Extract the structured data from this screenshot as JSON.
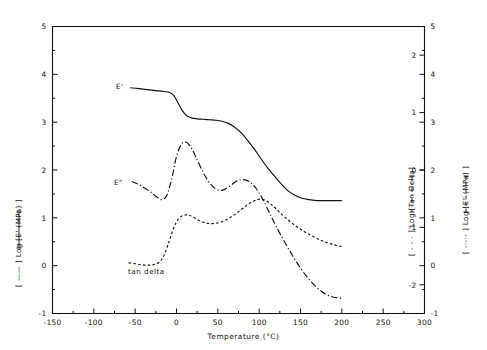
{
  "chart_data": {
    "type": "line",
    "title": "",
    "xlabel": "Temperature (°C)",
    "ylabel": "[ —— ] Log [E' (MPa) ]",
    "ylabel_right_inner": "[ - - - ] Log [Tan Delta]",
    "ylabel_right_outer": "[ -·-·- ] Log [E\" (MPa) ]",
    "xlim": [
      -150,
      300
    ],
    "ylim_left": [
      -1,
      5
    ],
    "ylim_right_inner": [
      -2.5,
      2.5
    ],
    "ylim_right_outer": [
      -1,
      5
    ],
    "xticks": [
      -150,
      -100,
      -50,
      0,
      50,
      100,
      150,
      200,
      250,
      300
    ],
    "xtick_labels": [
      "-150",
      "-100",
      "-50",
      "0",
      "50",
      "100",
      "150",
      "200",
      "250",
      "300"
    ],
    "xminor_step": 25,
    "yticks_left": [
      -1,
      0,
      1,
      2,
      3,
      4,
      5
    ],
    "ytick_labels_left": [
      "-1",
      "0",
      "1",
      "2",
      "3",
      "4",
      "5"
    ],
    "yminor_step_left": 0.5,
    "yticks_right_inner": [
      -2,
      -1,
      0,
      1,
      2
    ],
    "ytick_labels_right_inner": [
      "-2",
      "-1",
      "0",
      "1",
      "2"
    ],
    "yticks_right_outer": [
      -1,
      0,
      1,
      2,
      3,
      4,
      5
    ],
    "ytick_labels_right_outer": [
      "-1",
      "0",
      "1",
      "2",
      "3",
      "4",
      "5"
    ],
    "grid": false,
    "legend_position": "inline-annotations",
    "annotations": [
      {
        "text": "E'",
        "x": -116,
        "y": 3.85
      },
      {
        "text": "E\"",
        "x": -118,
        "y": 1.93
      },
      {
        "text": "tan delta",
        "x": -101,
        "y": 0.08
      }
    ],
    "series": [
      {
        "name": "E'",
        "style": "solid",
        "axis": "left",
        "color": "#111111",
        "x": [
          -56,
          -45,
          -35,
          -25,
          -15,
          -8,
          -3,
          2,
          7,
          12,
          18,
          25,
          32,
          40,
          48,
          55,
          62,
          70,
          78,
          86,
          94,
          102,
          110,
          118,
          126,
          134,
          142,
          150,
          160,
          170,
          180,
          190,
          200
        ],
        "y": [
          3.72,
          3.7,
          3.68,
          3.66,
          3.64,
          3.62,
          3.55,
          3.4,
          3.24,
          3.14,
          3.09,
          3.07,
          3.06,
          3.05,
          3.04,
          3.02,
          2.98,
          2.9,
          2.78,
          2.62,
          2.44,
          2.24,
          2.05,
          1.88,
          1.72,
          1.58,
          1.48,
          1.42,
          1.38,
          1.36,
          1.36,
          1.36,
          1.36
        ]
      },
      {
        "name": "E\"",
        "style": "dashdot",
        "axis": "left-displayed",
        "color": "#111111",
        "x": [
          -54,
          -46,
          -38,
          -30,
          -24,
          -18,
          -12,
          -6,
          0,
          6,
          12,
          18,
          24,
          32,
          40,
          48,
          56,
          64,
          72,
          80,
          88,
          96,
          104,
          112,
          120,
          130,
          140,
          150,
          160,
          170,
          180,
          190,
          200
        ],
        "y": [
          1.76,
          1.7,
          1.62,
          1.52,
          1.44,
          1.38,
          1.46,
          1.8,
          2.28,
          2.54,
          2.58,
          2.46,
          2.25,
          1.96,
          1.73,
          1.6,
          1.58,
          1.66,
          1.76,
          1.8,
          1.76,
          1.62,
          1.4,
          1.12,
          0.84,
          0.52,
          0.22,
          -0.05,
          -0.28,
          -0.46,
          -0.59,
          -0.66,
          -0.68
        ]
      },
      {
        "name": "tan delta",
        "style": "dashed",
        "axis": "left-displayed",
        "color": "#111111",
        "x": [
          -58,
          -50,
          -42,
          -34,
          -28,
          -22,
          -16,
          -10,
          -4,
          2,
          8,
          14,
          20,
          28,
          36,
          44,
          52,
          60,
          68,
          76,
          84,
          92,
          100,
          108,
          116,
          124,
          132,
          142,
          152,
          162,
          172,
          182,
          192,
          200
        ],
        "y": [
          0.06,
          0.04,
          0.02,
          0.01,
          0.02,
          0.06,
          0.18,
          0.45,
          0.76,
          0.97,
          1.05,
          1.06,
          1.02,
          0.94,
          0.89,
          0.88,
          0.9,
          0.96,
          1.04,
          1.14,
          1.25,
          1.34,
          1.39,
          1.36,
          1.26,
          1.13,
          1.0,
          0.86,
          0.74,
          0.64,
          0.55,
          0.48,
          0.43,
          0.4
        ]
      }
    ]
  },
  "labels": {
    "ep": "E'",
    "epp": "E\"",
    "tan_delta": "tan delta"
  }
}
